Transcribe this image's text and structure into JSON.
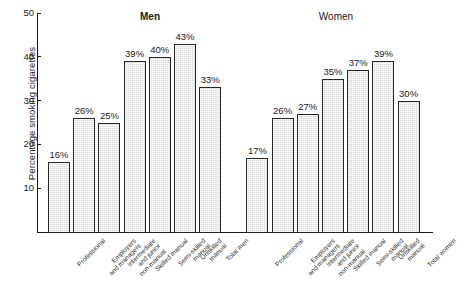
{
  "chart_data": {
    "type": "bar",
    "title": "",
    "xlabel": "",
    "ylabel": "Percentage smoking cigarettes",
    "ylim": [
      0,
      50
    ],
    "yticks": [
      10,
      20,
      30,
      40,
      50
    ],
    "grid": false,
    "legend": null,
    "group_titles": [
      "Men",
      "Women"
    ],
    "categories": [
      "Professional",
      "Employers\nand managers",
      "Intermediate\nand junior\nnon-manual",
      "Skilled manual",
      "Semi-skilled\nmanual",
      "Unskilled\nmanual",
      "Total men",
      "Professional",
      "Employers\nand managers",
      "Intermediate\nand junior\nnon-manual",
      "Skilled manual",
      "Semi-skilled\nmanual",
      "Unskilled\nmanual",
      "Total women"
    ],
    "values": [
      16,
      26,
      25,
      39,
      40,
      43,
      33,
      17,
      26,
      27,
      35,
      37,
      39,
      30
    ],
    "data_labels": [
      "16%",
      "26%",
      "25%",
      "39%",
      "40%",
      "43%",
      "33%",
      "17%",
      "26%",
      "27%",
      "35%",
      "37%",
      "39%",
      "30%"
    ],
    "groups": [
      {
        "name": "Men",
        "categories": [
          "Professional",
          "Employers and managers",
          "Intermediate and junior non-manual",
          "Skilled manual",
          "Semi-skilled manual",
          "Unskilled manual",
          "Total men"
        ],
        "values": [
          16,
          26,
          25,
          39,
          40,
          43,
          33
        ]
      },
      {
        "name": "Women",
        "categories": [
          "Professional",
          "Employers and managers",
          "Intermediate and junior non-manual",
          "Skilled manual",
          "Semi-skilled manual",
          "Unskilled manual",
          "Total women"
        ],
        "values": [
          17,
          26,
          27,
          35,
          37,
          39,
          30
        ]
      }
    ],
    "colors": {
      "bar_fill": "#d9d9d9",
      "bar_border": "#262626",
      "axis": "#1a1a1a",
      "text": "#1a1a1a",
      "background": "#ffffff"
    }
  }
}
